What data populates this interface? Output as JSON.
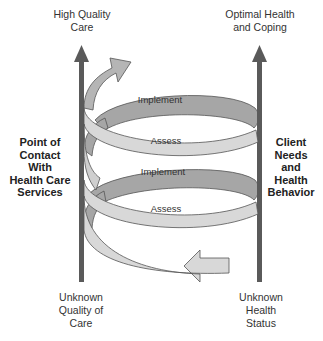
{
  "diagram": {
    "top_left_label": [
      "High Quality",
      "Care"
    ],
    "top_right_label": [
      "Optimal Health",
      "and Coping"
    ],
    "left_side_label": [
      "Point of",
      "Contact",
      "With",
      "Health Care",
      "Services"
    ],
    "right_side_label": [
      "Client",
      "Needs",
      "and",
      "Health",
      "Behavior"
    ],
    "bottom_left_label": [
      "Unknown",
      "Quality of",
      "Care"
    ],
    "bottom_right_label": [
      "Unknown",
      "Health",
      "Status"
    ],
    "spiral_labels": {
      "upper_implement": "Implement",
      "upper_assess": "Assess",
      "lower_implement": "Implement",
      "lower_assess": "Assess"
    },
    "colors": {
      "axis_arrow": "#5a5a5a",
      "ribbon_front": "#d8d8d8",
      "ribbon_back": "#a6a6a6",
      "ribbon_stroke": "#555555"
    }
  }
}
